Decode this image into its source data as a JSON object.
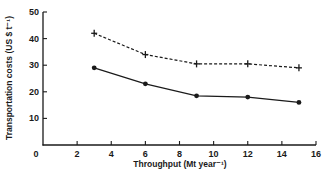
{
  "chart_data": {
    "type": "line",
    "title": "",
    "xlabel": "Throughput (Mt year⁻¹)",
    "ylabel": "Transportation costs (US $ t⁻¹)",
    "xlim": [
      0,
      16
    ],
    "ylim": [
      0,
      50
    ],
    "x_ticks": [
      2,
      4,
      6,
      8,
      10,
      12,
      14,
      16
    ],
    "y_ticks": [
      10,
      20,
      30,
      40,
      50
    ],
    "origin_label": "0",
    "grid": false,
    "legend": null,
    "x": [
      3,
      6,
      9,
      12,
      15
    ],
    "series": [
      {
        "name": "upper (dashed, + markers)",
        "style": "dashed",
        "marker": "plus",
        "values": [
          42,
          34,
          30.5,
          30.5,
          29
        ]
      },
      {
        "name": "lower (solid, filled circles)",
        "style": "solid",
        "marker": "circle",
        "values": [
          29,
          23,
          18.5,
          18,
          16
        ]
      }
    ]
  },
  "colors": {
    "ink": "#1a1a1a",
    "background": "#ffffff"
  }
}
